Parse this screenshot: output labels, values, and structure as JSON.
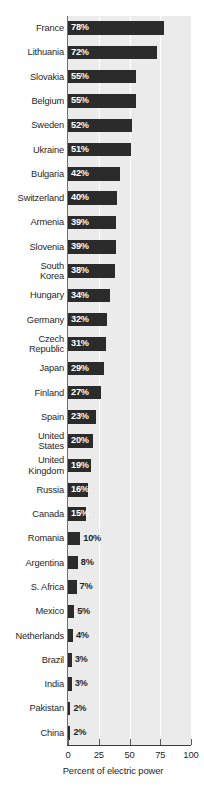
{
  "chart_data": {
    "type": "bar",
    "orientation": "horizontal",
    "title": "",
    "subtitle": "",
    "xlabel": "Percent of electric power",
    "ylabel": "",
    "xlim": [
      0,
      100
    ],
    "xticks": [
      0,
      25,
      50,
      75,
      100
    ],
    "xtick_labels": [
      "0",
      "25",
      "50",
      "75",
      "100"
    ],
    "grid": "vertical-white-gridlines-at-25-50-75",
    "legend": null,
    "value_suffix": "%",
    "categories": [
      "France",
      "Lithuania",
      "Slovakia",
      "Belgium",
      "Sweden",
      "Ukraine",
      "Bulgaria",
      "Switzerland",
      "Armenia",
      "Slovenia",
      "South Korea",
      "Hungary",
      "Germany",
      "Czech Republic",
      "Japan",
      "Finland",
      "Spain",
      "United States",
      "United Kingdom",
      "Russia",
      "Canada",
      "Romania",
      "Argentina",
      "S. Africa",
      "Mexico",
      "Netherlands",
      "Brazil",
      "India",
      "Pakistan",
      "China"
    ],
    "values": [
      78,
      72,
      55,
      55,
      52,
      51,
      42,
      40,
      39,
      39,
      38,
      34,
      32,
      31,
      29,
      27,
      23,
      20,
      19,
      16,
      15,
      10,
      8,
      7,
      5,
      4,
      3,
      3,
      2,
      2
    ],
    "data_labels": [
      "78%",
      "72%",
      "55%",
      "55%",
      "52%",
      "51%",
      "42%",
      "40%",
      "39%",
      "39%",
      "38%",
      "34%",
      "32%",
      "31%",
      "29%",
      "27%",
      "23%",
      "20%",
      "19%",
      "16%",
      "15%",
      "10%",
      "8%",
      "7%",
      "5%",
      "4%",
      "3%",
      "3%",
      "2%",
      "2%"
    ]
  },
  "rows": [
    {
      "label": "France",
      "value": 78,
      "data_label": "78%",
      "label_inside": true
    },
    {
      "label": "Lithuania",
      "value": 72,
      "data_label": "72%",
      "label_inside": true
    },
    {
      "label": "Slovakia",
      "value": 55,
      "data_label": "55%",
      "label_inside": true
    },
    {
      "label": "Belgium",
      "value": 55,
      "data_label": "55%",
      "label_inside": true
    },
    {
      "label": "Sweden",
      "value": 52,
      "data_label": "52%",
      "label_inside": true
    },
    {
      "label": "Ukraine",
      "value": 51,
      "data_label": "51%",
      "label_inside": true
    },
    {
      "label": "Bulgaria",
      "value": 42,
      "data_label": "42%",
      "label_inside": true
    },
    {
      "label": "Switzerland",
      "value": 40,
      "data_label": "40%",
      "label_inside": true
    },
    {
      "label": "Armenia",
      "value": 39,
      "data_label": "39%",
      "label_inside": true
    },
    {
      "label": "Slovenia",
      "value": 39,
      "data_label": "39%",
      "label_inside": true
    },
    {
      "label": "South\nKorea",
      "value": 38,
      "data_label": "38%",
      "label_inside": true
    },
    {
      "label": "Hungary",
      "value": 34,
      "data_label": "34%",
      "label_inside": true
    },
    {
      "label": "Germany",
      "value": 32,
      "data_label": "32%",
      "label_inside": true
    },
    {
      "label": "Czech\nRepublic",
      "value": 31,
      "data_label": "31%",
      "label_inside": true
    },
    {
      "label": "Japan",
      "value": 29,
      "data_label": "29%",
      "label_inside": true
    },
    {
      "label": "Finland",
      "value": 27,
      "data_label": "27%",
      "label_inside": true
    },
    {
      "label": "Spain",
      "value": 23,
      "data_label": "23%",
      "label_inside": true
    },
    {
      "label": "United\nStates",
      "value": 20,
      "data_label": "20%",
      "label_inside": true
    },
    {
      "label": "United\nKingdom",
      "value": 19,
      "data_label": "19%",
      "label_inside": true
    },
    {
      "label": "Russia",
      "value": 16,
      "data_label": "16%",
      "label_inside": true
    },
    {
      "label": "Canada",
      "value": 15,
      "data_label": "15%",
      "label_inside": true
    },
    {
      "label": "Romania",
      "value": 10,
      "data_label": "10%",
      "label_inside": false
    },
    {
      "label": "Argentina",
      "value": 8,
      "data_label": "8%",
      "label_inside": false
    },
    {
      "label": "S. Africa",
      "value": 7,
      "data_label": "7%",
      "label_inside": false
    },
    {
      "label": "Mexico",
      "value": 5,
      "data_label": "5%",
      "label_inside": false
    },
    {
      "label": "Netherlands",
      "value": 4,
      "data_label": "4%",
      "label_inside": false
    },
    {
      "label": "Brazil",
      "value": 3,
      "data_label": "3%",
      "label_inside": false
    },
    {
      "label": "India",
      "value": 3,
      "data_label": "3%",
      "label_inside": false
    },
    {
      "label": "Pakistan",
      "value": 2,
      "data_label": "2%",
      "label_inside": false
    },
    {
      "label": "China",
      "value": 2,
      "data_label": "2%",
      "label_inside": false
    }
  ],
  "axis": {
    "x_title": "Percent of electric power",
    "ticks": [
      "0",
      "25",
      "50",
      "75",
      "100"
    ],
    "tick_values": [
      0,
      25,
      50,
      75,
      100
    ]
  },
  "colors": {
    "bar": "#2b2b2b",
    "plot_background": "#ebebeb",
    "gridline": "#ffffff",
    "axis": "#3a3a3a",
    "page_background": "#ffffff",
    "text": "#1f1f1f",
    "inside_label_text": "#ffffff"
  }
}
